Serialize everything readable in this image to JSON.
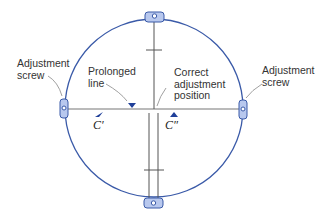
{
  "diagram": {
    "labels": {
      "left_screw": [
        "Adjustment",
        "screw"
      ],
      "right_screw": [
        "Adjustment",
        "screw"
      ],
      "prolonged_line": [
        "Prolonged",
        "line"
      ],
      "correct_position": [
        "Correct",
        "adjustment",
        "position"
      ],
      "c_prime": "C′",
      "c_double_prime": "C″"
    },
    "colors": {
      "circle": "#3a5aa8",
      "screw_fill": "#b8c8ee",
      "screw_stroke": "#3a5aa8",
      "line": "#555555",
      "marker": "#1f3f99"
    }
  }
}
